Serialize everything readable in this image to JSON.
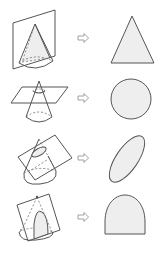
{
  "figure": {
    "title_fragment": "",
    "rows": [
      {
        "id": "vertical-section",
        "solid": "cone",
        "cutting_plane": "vertical plane through apex",
        "arrow": "⇨",
        "result_shape": "triangle",
        "label": "Triangle"
      },
      {
        "id": "horizontal-section",
        "solid": "cone",
        "cutting_plane": "horizontal plane parallel to base",
        "arrow": "⇨",
        "result_shape": "circle",
        "label": "Circle"
      },
      {
        "id": "oblique-section",
        "solid": "cone",
        "cutting_plane": "oblique plane",
        "arrow": "⇨",
        "result_shape": "ellipse",
        "label": "Ellipse"
      },
      {
        "id": "parabolic-section",
        "solid": "cone",
        "cutting_plane": "plane parallel to slant edge",
        "arrow": "⇨",
        "result_shape": "parabola",
        "label": "Parabola"
      }
    ],
    "colors": {
      "line": "#555555",
      "section_fill": "#eeeeee",
      "arrow_stroke": "#8a8a8a",
      "background": "#ffffff"
    }
  }
}
